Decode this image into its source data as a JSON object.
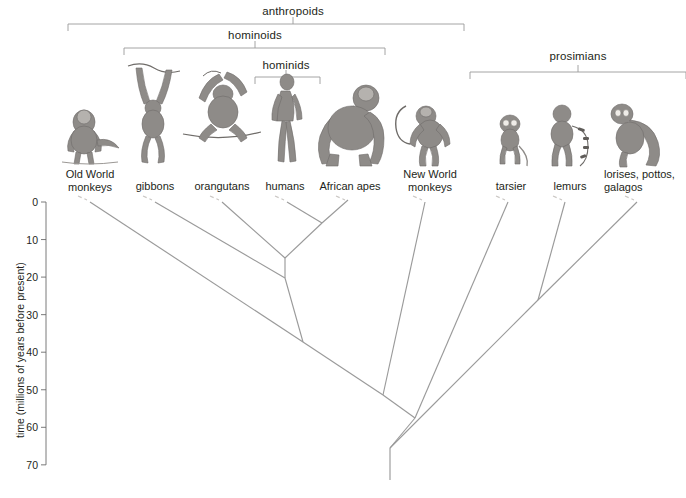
{
  "figure": {
    "type": "phylogenetic-tree",
    "line_color": "#9a9a9a",
    "text_color": "#231f20",
    "background": "#ffffff"
  },
  "axis": {
    "title": "time (millions of years before present)",
    "unit": "millions of years before present",
    "ticks": [
      {
        "label": "0",
        "value": 0
      },
      {
        "label": "10",
        "value": 10
      },
      {
        "label": "20",
        "value": 20
      },
      {
        "label": "30",
        "value": 30
      },
      {
        "label": "40",
        "value": 40
      },
      {
        "label": "50",
        "value": 50
      },
      {
        "label": "60",
        "value": 60
      },
      {
        "label": "70",
        "value": 70
      }
    ],
    "range": [
      0,
      70
    ],
    "direction": "top-is-present"
  },
  "clade_brackets": [
    {
      "id": "anthropoids",
      "label": "anthropoids",
      "label_x": 293,
      "label_y": 5,
      "bracket_y": 24,
      "x_start": 68,
      "x_end": 464,
      "tick_x": 293
    },
    {
      "id": "hominoids",
      "label": "hominoids",
      "label_x": 255,
      "label_y": 29,
      "bracket_y": 48,
      "x_start": 124,
      "x_end": 385,
      "tick_x": 255
    },
    {
      "id": "hominids",
      "label": "hominids",
      "label_x": 286,
      "label_y": 59,
      "bracket_y": 77,
      "x_start": 255,
      "x_end": 320,
      "tick_x": 286
    },
    {
      "id": "prosimians",
      "label": "prosimians",
      "label_x": 578,
      "label_y": 50,
      "bracket_y": 72,
      "x_start": 470,
      "x_end": 686,
      "tick_x": 578
    }
  ],
  "taxa": [
    {
      "id": "old-world-monkeys",
      "label": "Old World\nmonkeys",
      "x": 90,
      "label_y": 168,
      "tip_x": 90,
      "align": "center"
    },
    {
      "id": "gibbons",
      "label": "gibbons",
      "x": 155,
      "label_y": 180,
      "tip_x": 155,
      "align": "center"
    },
    {
      "id": "orangutans",
      "label": "orangutans",
      "x": 222,
      "label_y": 180,
      "tip_x": 222,
      "align": "center"
    },
    {
      "id": "humans",
      "label": "humans",
      "x": 285,
      "label_y": 180,
      "tip_x": 287,
      "align": "center"
    },
    {
      "id": "african-apes",
      "label": "African apes",
      "x": 350,
      "label_y": 180,
      "tip_x": 348,
      "align": "center"
    },
    {
      "id": "new-world-monkeys",
      "label": "New World\nmonkeys",
      "x": 430,
      "label_y": 168,
      "tip_x": 425,
      "align": "center"
    },
    {
      "id": "tarsier",
      "label": "tarsier",
      "x": 511,
      "label_y": 180,
      "tip_x": 508,
      "align": "center"
    },
    {
      "id": "lemurs",
      "label": "lemurs",
      "x": 570,
      "label_y": 180,
      "tip_x": 565,
      "align": "center"
    },
    {
      "id": "lorises-pottos-galagos",
      "label": "lorises, pottos,\ngalagos",
      "x": 604,
      "label_y": 168,
      "tip_x": 637,
      "align": "left"
    }
  ],
  "chart_data": {
    "type": "tree",
    "ylabel": "time (millions of years before present)",
    "ylim": [
      0,
      70
    ],
    "grid": false,
    "legend": "none",
    "tips": [
      "Old World monkeys",
      "gibbons",
      "orangutans",
      "humans",
      "African apes",
      "New World monkeys",
      "tarsier",
      "lemurs",
      "lorises, pottos, galagos"
    ],
    "nodes": [
      {
        "id": "human-africanape",
        "members": [
          "humans",
          "African apes"
        ],
        "age_mya": 5.5
      },
      {
        "id": "great-apes",
        "members": [
          "humans",
          "African apes",
          "orangutans"
        ],
        "age_mya": 15
      },
      {
        "id": "hominoids",
        "members": [
          "humans",
          "African apes",
          "orangutans",
          "gibbons"
        ],
        "age_mya": 20
      },
      {
        "id": "catarrhines",
        "members": [
          "hominoids",
          "Old World monkeys"
        ],
        "age_mya": 37
      },
      {
        "id": "anthropoids",
        "members": [
          "catarrhines",
          "New World monkeys"
        ],
        "age_mya": 51
      },
      {
        "id": "haplorhines",
        "members": [
          "anthropoids",
          "tarsier"
        ],
        "age_mya": 57.5
      },
      {
        "id": "strepsirrhines",
        "members": [
          "lemurs",
          "lorises, pottos, galagos"
        ],
        "age_mya": 26
      },
      {
        "id": "primate-root",
        "members": [
          "haplorhines",
          "strepsirrhines"
        ],
        "age_mya": 65
      },
      {
        "id": "stem",
        "members": [
          "primates"
        ],
        "age_mya": 70
      }
    ]
  },
  "geometry": {
    "y_zero_px": 202,
    "px_per_10my": 37.55,
    "axis_x": 46,
    "branches": [
      {
        "name": "old-world-monkeys-branch",
        "points": "90,202 303,342"
      },
      {
        "name": "gibbons-branch",
        "points": "155,202 285,278"
      },
      {
        "name": "orangutans-branch",
        "points": "222,202 285,258"
      },
      {
        "name": "humans-branch",
        "points": "287,202 322,223"
      },
      {
        "name": "african-apes-branch",
        "points": "348,200 322,223"
      },
      {
        "name": "great-ape-stem",
        "points": "322,223 285,258"
      },
      {
        "name": "great-ape-vertical",
        "points": "285,258 285,278"
      },
      {
        "name": "hominoid-stem",
        "points": "285,278 303,342"
      },
      {
        "name": "catarrhine-stem",
        "points": "303,342 383,395"
      },
      {
        "name": "new-world-monkeys-branch",
        "points": "425,202 383,395"
      },
      {
        "name": "anthropoid-stem",
        "points": "383,395 415,418"
      },
      {
        "name": "tarsier-branch",
        "points": "508,202 415,418"
      },
      {
        "name": "haplorhine-stem",
        "points": "415,418 390,448"
      },
      {
        "name": "lemurs-branch",
        "points": "565,202 538,300"
      },
      {
        "name": "lorises-branch",
        "points": "637,202 538,300"
      },
      {
        "name": "strepsirrhine-stem",
        "points": "538,300 390,448"
      },
      {
        "name": "root-stem",
        "points": "390,448 390,480"
      }
    ]
  }
}
